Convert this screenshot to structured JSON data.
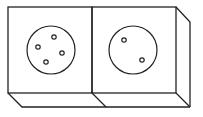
{
  "diagram": {
    "stroke_color": "#222222",
    "background": "#ffffff",
    "faces": [
      {
        "name": "left-face",
        "circle": {
          "cx": 51,
          "cy": 50,
          "r": 24
        },
        "holes": [
          {
            "cx": 54,
            "cy": 37
          },
          {
            "cx": 38,
            "cy": 47
          },
          {
            "cx": 62,
            "cy": 53
          },
          {
            "cx": 46,
            "cy": 62
          }
        ]
      },
      {
        "name": "right-face",
        "circle": {
          "cx": 133,
          "cy": 50,
          "r": 24
        },
        "holes": [
          {
            "cx": 124,
            "cy": 40
          },
          {
            "cx": 142,
            "cy": 60
          }
        ]
      }
    ]
  }
}
